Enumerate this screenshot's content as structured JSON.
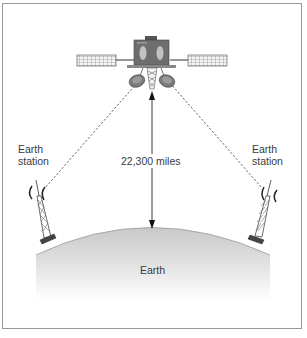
{
  "diagram": {
    "labels": {
      "left_station": [
        "Earth",
        "station"
      ],
      "right_station": [
        "Earth",
        "station"
      ],
      "distance": "22,300 miles",
      "earth": "Earth"
    },
    "nodes": [
      {
        "id": "satellite",
        "type": "satellite"
      },
      {
        "id": "earth-station-left",
        "type": "antenna-tower",
        "label": "Earth station"
      },
      {
        "id": "earth-station-right",
        "type": "antenna-tower",
        "label": "Earth station"
      },
      {
        "id": "earth",
        "type": "planet-surface",
        "label": "Earth"
      }
    ],
    "edges": [
      {
        "from": "earth-station-left",
        "to": "satellite",
        "style": "dashed"
      },
      {
        "from": "satellite",
        "to": "earth-station-right",
        "style": "dashed"
      },
      {
        "from": "satellite",
        "to": "earth",
        "style": "double-arrow",
        "label": "22,300 miles"
      }
    ],
    "colors": {
      "frame": "#9a9a9a",
      "satellite_body": "#6e6e6e",
      "earth_top": "#cfcfcf",
      "earth_bottom": "#ffffff",
      "line": "#333333",
      "text": "#3a3a3a"
    }
  }
}
